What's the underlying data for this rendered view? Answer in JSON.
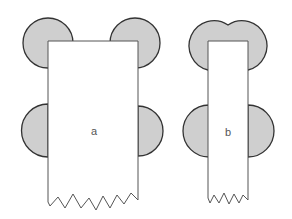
{
  "figure": {
    "colors": {
      "lobe_fill": "#cfcfcf",
      "lobe_stroke": "#333333",
      "rect_fill": "#ffffff",
      "rect_stroke": "#555555",
      "background": "#ffffff"
    },
    "panels": [
      {
        "id": "a",
        "label": "a",
        "description": "Wide rectangle with four circular lobes at corners/sides and jagged (torn) bottom edge"
      },
      {
        "id": "b",
        "label": "b",
        "description": "Narrow rectangle with merged heart-shaped top lobes, two side lobes, and jagged (torn) bottom edge"
      }
    ]
  }
}
